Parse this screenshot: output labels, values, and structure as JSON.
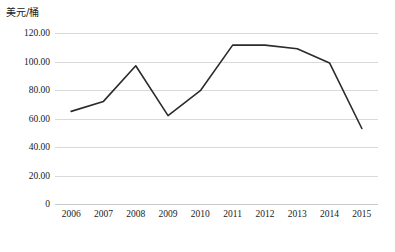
{
  "chart_data": {
    "type": "line",
    "title": "",
    "subtitle": "",
    "xlabel": "",
    "ylabel": "美元/桶",
    "categories": [
      "2006",
      "2007",
      "2008",
      "2009",
      "2010",
      "2011",
      "2012",
      "2013",
      "2014",
      "2015"
    ],
    "values": [
      65.0,
      72.0,
      97.0,
      62.0,
      79.5,
      111.5,
      111.5,
      109.0,
      99.0,
      53.0
    ],
    "series": [
      {
        "name": "原油价格",
        "values": [
          65.0,
          72.0,
          97.0,
          62.0,
          79.5,
          111.5,
          111.5,
          109.0,
          99.0,
          53.0
        ]
      }
    ],
    "ylim": [
      0,
      120
    ],
    "yticks": [
      0,
      20,
      40,
      60,
      80,
      100,
      120
    ],
    "ytick_labels": [
      "0",
      "20.00",
      "40.00",
      "60.00",
      "80.00",
      "100.00",
      "120.00"
    ],
    "grid": true,
    "grid_axis": "y",
    "legend": "none",
    "line_color": "#2b2b2b",
    "grid_color": "#d9d9d9",
    "background_color": "#ffffff",
    "markers": false
  }
}
